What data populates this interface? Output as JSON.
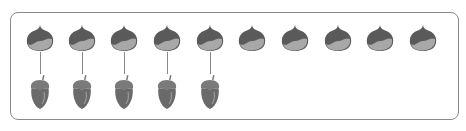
{
  "diagram": {
    "top_row": {
      "item": "chestnut",
      "count": 10
    },
    "bottom_row": {
      "item": "acorn",
      "count": 5
    },
    "matched_pairs": 5,
    "unmatched_top": 5,
    "chestnut_x": [
      40,
      82,
      124,
      167,
      210,
      252,
      295,
      338,
      380,
      423
    ],
    "acorn_x": [
      40,
      82,
      124,
      167,
      210
    ],
    "colors": {
      "border": "#8a8a8a",
      "chestnut_dark": "#5a5a5a",
      "chestnut_light": "#a8a8a8",
      "acorn_cap": "#7a7a7a",
      "acorn_body": "#6a6a6a",
      "line": "#888888"
    }
  }
}
